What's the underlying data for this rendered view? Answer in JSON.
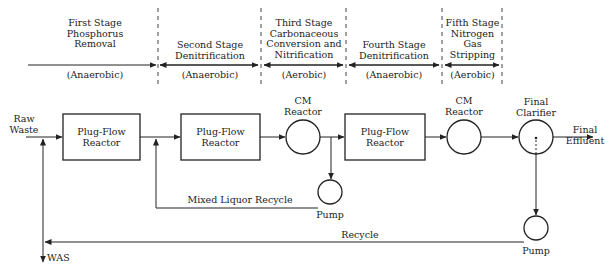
{
  "stages": [
    {
      "title": [
        "First Stage",
        "Phosphorus",
        "Removal"
      ],
      "condition": "(Anaerobic)"
    },
    {
      "title": [
        "Second Stage",
        "Denitrification"
      ],
      "condition": "(Anaerobic)"
    },
    {
      "title": [
        "Third Stage",
        "Carbonaceous",
        "Conversion and",
        "Nitrification"
      ],
      "condition": "(Aerobic)"
    },
    {
      "title": [
        "Fourth Stage",
        "Denitrification"
      ],
      "condition": "(Anaerobic)"
    },
    {
      "title": [
        "Fifth Stage",
        "Nitrogen",
        "Gas",
        "Stripping"
      ],
      "condition": "(Aerobic)"
    }
  ],
  "inlet": {
    "line1": "Raw",
    "line2": "Waste"
  },
  "units": {
    "pfr1": {
      "line1": "Plug-Flow",
      "line2": "Reactor"
    },
    "pfr2": {
      "line1": "Plug-Flow",
      "line2": "Reactor"
    },
    "cm1": {
      "line1": "CM",
      "line2": "Reactor"
    },
    "pfr3": {
      "line1": "Plug-Flow",
      "line2": "Reactor"
    },
    "cm2": {
      "line1": "CM",
      "line2": "Reactor"
    },
    "clarifier": {
      "line1": "Final",
      "line2": "Clarifier"
    },
    "pump1": "Pump",
    "pump2": "Pump"
  },
  "outlet": {
    "line1": "Final",
    "line2": "Effluent"
  },
  "streams": {
    "mixed_liquor_recycle": "Mixed Liquor Recycle",
    "recycle": "Recycle",
    "was": "WAS"
  }
}
